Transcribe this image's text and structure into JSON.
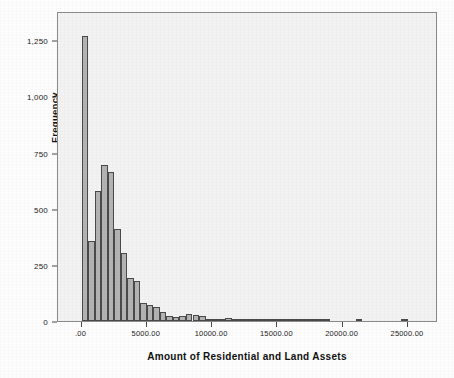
{
  "chart_data": {
    "type": "bar",
    "title": "",
    "xlabel": "Amount of Residential and Land Assets",
    "ylabel": "Frequency",
    "xlim": [
      -1800,
      27300
    ],
    "ylim": [
      0,
      1380
    ],
    "grid": false,
    "legend": null,
    "bin_width": 500,
    "xtick_labels": [
      ".00",
      "5000.00",
      "10000.00",
      "15000.00",
      "20000.00",
      "25000.00"
    ],
    "xtick_values": [
      0,
      5000,
      10000,
      15000,
      20000,
      25000
    ],
    "ytick_labels": [
      "0",
      "250",
      "500",
      "750",
      "1,000",
      "1,250"
    ],
    "ytick_values": [
      0,
      250,
      500,
      750,
      1000,
      1250
    ],
    "bin_centers": [
      250,
      750,
      1250,
      1750,
      2250,
      2750,
      3250,
      3750,
      4250,
      4750,
      5250,
      5750,
      6250,
      6750,
      7250,
      7750,
      8250,
      8750,
      9250,
      9750,
      10250,
      10750,
      11250,
      11750,
      12250,
      12750,
      13250,
      13750,
      14250,
      14750,
      15250,
      15750,
      16250,
      16750,
      17250,
      17750,
      18250,
      18750,
      19250,
      19750,
      20250,
      20750,
      21250,
      21750,
      22250,
      22750,
      23250,
      23750,
      24250,
      24750
    ],
    "values": [
      1268,
      358,
      580,
      695,
      665,
      410,
      305,
      190,
      178,
      80,
      70,
      62,
      40,
      22,
      20,
      24,
      30,
      28,
      24,
      8,
      7,
      7,
      14,
      6,
      4,
      3,
      3,
      2,
      2,
      2,
      1,
      1,
      1,
      1,
      1,
      1,
      1,
      1,
      0,
      0,
      0,
      0,
      1,
      0,
      0,
      0,
      0,
      0,
      0,
      1
    ],
    "bar_fill_color": "#b3b3b3",
    "bar_edge_color": "#4a4a4a",
    "plot_background_color": "#f2f2f2",
    "frame_color": "#8a8a8a"
  }
}
